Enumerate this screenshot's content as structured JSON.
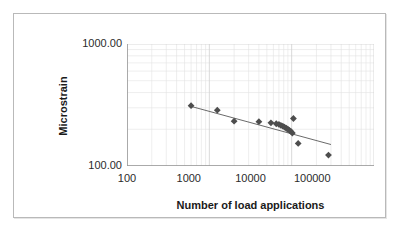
{
  "chart_data": {
    "type": "scatter",
    "title": "",
    "xlabel": "Number of load applications",
    "ylabel": "Microstrain",
    "xscale": "log",
    "yscale": "log",
    "xlim": [
      100,
      100000
    ],
    "ylim": [
      100,
      1000
    ],
    "grid": true,
    "minor_grid": true,
    "legend": "none",
    "xticks": [
      "100",
      "1000",
      "10000",
      "100000"
    ],
    "xtick_values": [
      100,
      1000,
      10000,
      100000
    ],
    "yticks": [
      "100.00",
      "1000.00"
    ],
    "ytick_values": [
      100,
      1000
    ],
    "marker": "diamond",
    "marker_color": "#4d4d4d",
    "line_color": "#595959",
    "gridline_color": "#d8d8d8",
    "series": [
      {
        "name": "Measured data",
        "points": [
          [
            600,
            312
          ],
          [
            1250,
            287
          ],
          [
            2000,
            233
          ],
          [
            4000,
            231
          ],
          [
            5600,
            226
          ],
          [
            6500,
            222
          ],
          [
            7000,
            219
          ],
          [
            7400,
            215
          ],
          [
            7800,
            212
          ],
          [
            8200,
            208
          ],
          [
            8600,
            204
          ],
          [
            9000,
            200
          ],
          [
            9400,
            196
          ],
          [
            9800,
            192
          ],
          [
            10200,
            186
          ],
          [
            10500,
            245
          ],
          [
            12000,
            153
          ],
          [
            28000,
            123
          ]
        ]
      }
    ],
    "trendline": {
      "name": "Power-law fit",
      "x_start": 600,
      "y_start": 308,
      "x_end": 30000,
      "y_end": 150
    }
  }
}
